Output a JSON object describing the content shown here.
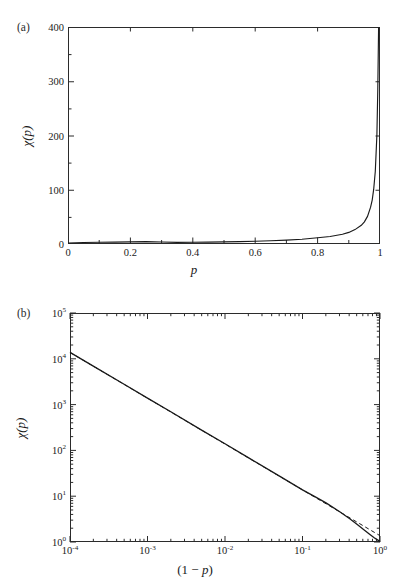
{
  "figure": {
    "width": 409,
    "height": 585,
    "background": "#ffffff",
    "curve_color": "#1a1a1a",
    "axis_color": "#2b2b2b"
  },
  "panel_a": {
    "label": "(a)",
    "xlabel": "p",
    "ylabel_chi": "χ",
    "ylabel_arg": "(p)",
    "x_ticks": [
      "0",
      "0.2",
      "0.4",
      "0.6",
      "0.8",
      "1"
    ],
    "x_tick_values": [
      0,
      0.2,
      0.4,
      0.6,
      0.8,
      1
    ],
    "x_minor_values": [
      0.1,
      0.3,
      0.5,
      0.7,
      0.9
    ],
    "y_ticks": [
      "0",
      "100",
      "200",
      "300",
      "400"
    ],
    "y_tick_values": [
      0,
      100,
      200,
      300,
      400
    ],
    "y_minor_values": [
      50,
      150,
      250,
      350
    ],
    "xlim": [
      0,
      1
    ],
    "ylim": [
      0,
      400
    ]
  },
  "panel_b": {
    "label": "(b)",
    "xlabel_open": "(1 ",
    "xlabel_minus": "− ",
    "xlabel_p": "p",
    "xlabel_close": ")",
    "ylabel_chi": "χ",
    "ylabel_arg": "(p)",
    "x_ticks": [
      {
        "mant": "10",
        "exp": "-4",
        "value": -4
      },
      {
        "mant": "10",
        "exp": "-3",
        "value": -3
      },
      {
        "mant": "10",
        "exp": "-2",
        "value": -2
      },
      {
        "mant": "10",
        "exp": "-1",
        "value": -1
      },
      {
        "mant": "10",
        "exp": "0",
        "value": 0
      }
    ],
    "y_ticks": [
      {
        "mant": "10",
        "exp": "0",
        "value": 0
      },
      {
        "mant": "10",
        "exp": "1",
        "value": 1
      },
      {
        "mant": "10",
        "exp": "2",
        "value": 2
      },
      {
        "mant": "10",
        "exp": "3",
        "value": 3
      },
      {
        "mant": "10",
        "exp": "4",
        "value": 4
      },
      {
        "mant": "10",
        "exp": "5",
        "value": 5
      }
    ],
    "xlim_log": [
      -4,
      0
    ],
    "ylim_log": [
      0,
      5
    ]
  },
  "chart_data": [
    {
      "type": "line",
      "id": "panel-a",
      "title": "",
      "xlabel": "p",
      "ylabel": "χ(p)",
      "xlim": [
        0,
        1
      ],
      "ylim": [
        0,
        400
      ],
      "xscale": "linear",
      "yscale": "linear",
      "grid": false,
      "legend": "none",
      "annotations": [
        "(a)"
      ],
      "series": [
        {
          "name": "chi(p)",
          "style": "solid",
          "comment": "chi = 1/(1-p) - like divergence; chi(p) approx (1-p)^-1 scaled",
          "x": [
            0.0,
            0.05,
            0.1,
            0.15,
            0.2,
            0.25,
            0.3,
            0.35,
            0.4,
            0.45,
            0.5,
            0.55,
            0.6,
            0.65,
            0.7,
            0.75,
            0.8,
            0.84,
            0.88,
            0.9,
            0.92,
            0.94,
            0.95,
            0.96,
            0.97,
            0.975,
            0.98,
            0.985,
            0.99,
            0.993,
            0.995,
            0.9965,
            0.998,
            0.999,
            1.0
          ],
          "y": [
            1.0,
            1.1,
            1.2,
            1.3,
            1.4,
            1.6,
            1.8,
            2.0,
            2.3,
            2.6,
            3.0,
            3.5,
            4.2,
            5.1,
            6.3,
            8.0,
            10.5,
            13.0,
            17.0,
            20.5,
            25.5,
            33.5,
            40.0,
            50.0,
            67.0,
            80.0,
            100.0,
            133.0,
            200.0,
            285.0,
            400.0,
            400.0,
            400.0,
            400.0,
            400.0
          ]
        }
      ]
    },
    {
      "type": "line",
      "id": "panel-b",
      "title": "",
      "xlabel": "(1 − p)",
      "ylabel": "χ(p)",
      "xlim": [
        0.0001,
        1
      ],
      "ylim": [
        1,
        100000
      ],
      "xscale": "log",
      "yscale": "log",
      "grid": false,
      "legend": "none",
      "annotations": [
        "(b)"
      ],
      "series": [
        {
          "name": "chi(p) exact",
          "style": "solid",
          "x": [
            0.0001,
            0.0002,
            0.0005,
            0.001,
            0.002,
            0.005,
            0.01,
            0.02,
            0.05,
            0.1,
            0.15,
            0.2,
            0.3,
            0.4,
            0.5,
            0.6,
            0.7,
            0.8,
            0.9,
            1.0
          ],
          "y": [
            20000,
            10000,
            4000,
            2000,
            1000,
            400,
            200,
            100,
            40,
            19.5,
            13.0,
            9.6,
            6.0,
            4.1,
            2.9,
            2.15,
            1.7,
            1.4,
            1.15,
            1.0
          ]
        },
        {
          "name": "power-law asymptote",
          "style": "dashed",
          "x": [
            0.0001,
            0.001,
            0.01,
            0.1,
            0.2,
            0.4,
            0.7,
            1.0
          ],
          "y": [
            20000,
            2000,
            200,
            20,
            10,
            5,
            2.86,
            2.0
          ]
        }
      ]
    }
  ]
}
